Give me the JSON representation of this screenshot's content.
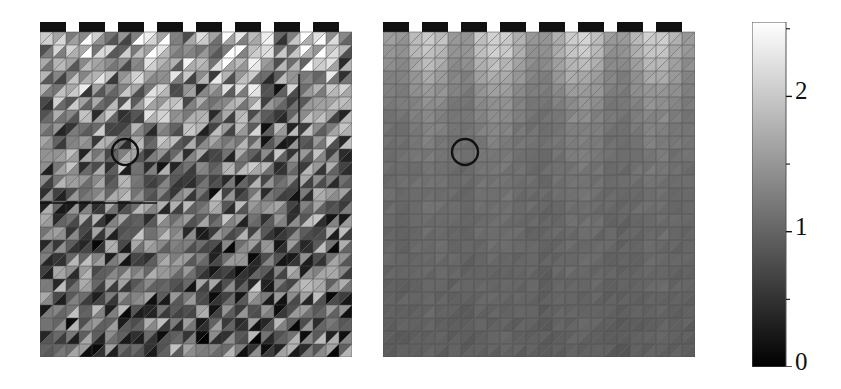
{
  "figure": {
    "title": "",
    "background": "#ffffff",
    "width": 841,
    "height": 389
  },
  "chart_data": {
    "type": "heatmap",
    "title": "",
    "xlabel": "",
    "ylabel": "",
    "colormap": "gray",
    "colorbar": {
      "orientation": "vertical",
      "position": "right",
      "vmin": 0,
      "vmax": 2.55,
      "ticks": [
        0,
        1,
        2
      ],
      "tick_labels": [
        "0",
        "1",
        "2"
      ],
      "low_color": "#000000",
      "high_color": "#ffffff"
    },
    "grid": {
      "nx": 24,
      "ny": 25,
      "cell_px": 13,
      "element": "triangle",
      "mesh_line_color": "#4a4a4a",
      "diagonal": "backslash"
    },
    "crenellations": {
      "count": 8,
      "color": "#111111",
      "block_cells": 2,
      "gap_cells": 1
    },
    "panels": [
      {
        "name": "left-panel",
        "label": "",
        "x": 40,
        "y": 22,
        "width": 312,
        "height": 349,
        "field": "noisy",
        "value_range": [
          0.0,
          2.5
        ],
        "noise_amplitude": 0.85,
        "annotations": {
          "circle": {
            "cx": 125,
            "cy": 152,
            "r": 13,
            "color": "#111111"
          },
          "hline": {
            "x1": 40,
            "x2": 157,
            "y": 203,
            "color": "#111111"
          },
          "vline": {
            "x": 299,
            "y1": 74,
            "y2": 203,
            "color": "#111111"
          }
        }
      },
      {
        "name": "right-panel",
        "label": "",
        "x": 383,
        "y": 22,
        "width": 312,
        "height": 347,
        "field": "smooth",
        "value_range": [
          0.55,
          2.2
        ],
        "noise_amplitude": 0.06,
        "annotations": {
          "circle": {
            "cx": 465,
            "cy": 152,
            "r": 13,
            "color": "#111111"
          }
        }
      }
    ],
    "base_field_rows": [
      [
        1.55,
        1.5,
        1.9,
        2.05,
        1.9,
        1.55,
        1.5,
        1.95,
        2.1,
        2.05,
        1.8,
        1.55,
        1.5,
        1.75,
        2.05,
        2.1,
        1.9,
        1.55,
        1.5,
        1.8,
        2.05,
        2.05,
        1.8,
        1.55
      ],
      [
        1.48,
        1.45,
        1.8,
        1.98,
        1.84,
        1.5,
        1.45,
        1.86,
        2.02,
        1.98,
        1.72,
        1.48,
        1.44,
        1.68,
        1.98,
        2.02,
        1.82,
        1.48,
        1.44,
        1.72,
        1.98,
        1.98,
        1.72,
        1.48
      ],
      [
        1.4,
        1.38,
        1.66,
        1.84,
        1.72,
        1.42,
        1.38,
        1.72,
        1.88,
        1.84,
        1.6,
        1.4,
        1.36,
        1.58,
        1.84,
        1.88,
        1.7,
        1.4,
        1.36,
        1.6,
        1.84,
        1.84,
        1.6,
        1.4
      ],
      [
        1.32,
        1.3,
        1.52,
        1.68,
        1.58,
        1.34,
        1.3,
        1.58,
        1.72,
        1.68,
        1.48,
        1.32,
        1.28,
        1.46,
        1.68,
        1.72,
        1.56,
        1.32,
        1.28,
        1.48,
        1.68,
        1.68,
        1.48,
        1.32
      ],
      [
        1.26,
        1.24,
        1.42,
        1.54,
        1.46,
        1.28,
        1.24,
        1.46,
        1.58,
        1.54,
        1.38,
        1.26,
        1.22,
        1.36,
        1.54,
        1.58,
        1.44,
        1.26,
        1.22,
        1.38,
        1.54,
        1.54,
        1.38,
        1.26
      ],
      [
        1.22,
        1.2,
        1.34,
        1.44,
        1.38,
        1.23,
        1.2,
        1.38,
        1.48,
        1.44,
        1.3,
        1.22,
        1.18,
        1.28,
        1.44,
        1.48,
        1.36,
        1.22,
        1.18,
        1.3,
        1.44,
        1.44,
        1.3,
        1.22
      ],
      [
        1.18,
        1.17,
        1.28,
        1.36,
        1.31,
        1.19,
        1.16,
        1.31,
        1.39,
        1.36,
        1.25,
        1.18,
        1.15,
        1.23,
        1.36,
        1.39,
        1.3,
        1.18,
        1.15,
        1.25,
        1.36,
        1.36,
        1.25,
        1.18
      ],
      [
        1.15,
        1.14,
        1.23,
        1.3,
        1.26,
        1.16,
        1.13,
        1.26,
        1.32,
        1.3,
        1.2,
        1.15,
        1.12,
        1.19,
        1.3,
        1.32,
        1.25,
        1.15,
        1.12,
        1.2,
        1.3,
        1.3,
        1.2,
        1.15
      ],
      [
        1.13,
        1.12,
        1.19,
        1.25,
        1.21,
        1.13,
        1.11,
        1.21,
        1.27,
        1.25,
        1.17,
        1.13,
        1.1,
        1.16,
        1.25,
        1.27,
        1.21,
        1.13,
        1.1,
        1.17,
        1.25,
        1.25,
        1.17,
        1.13
      ],
      [
        1.11,
        1.1,
        1.16,
        1.21,
        1.18,
        1.11,
        1.09,
        1.18,
        1.23,
        1.21,
        1.14,
        1.11,
        1.08,
        1.13,
        1.21,
        1.23,
        1.18,
        1.11,
        1.08,
        1.14,
        1.21,
        1.21,
        1.14,
        1.11
      ],
      [
        1.09,
        1.08,
        1.14,
        1.18,
        1.15,
        1.09,
        1.07,
        1.15,
        1.19,
        1.18,
        1.12,
        1.09,
        1.06,
        1.11,
        1.18,
        1.19,
        1.15,
        1.09,
        1.06,
        1.12,
        1.18,
        1.18,
        1.12,
        1.09
      ],
      [
        1.08,
        1.07,
        1.12,
        1.15,
        1.13,
        1.08,
        1.06,
        1.13,
        1.16,
        1.15,
        1.1,
        1.08,
        1.05,
        1.09,
        1.15,
        1.16,
        1.13,
        1.08,
        1.05,
        1.1,
        1.15,
        1.15,
        1.1,
        1.08
      ],
      [
        1.06,
        1.05,
        1.1,
        1.13,
        1.11,
        1.06,
        1.04,
        1.11,
        1.14,
        1.13,
        1.08,
        1.06,
        1.03,
        1.07,
        1.13,
        1.14,
        1.11,
        1.06,
        1.03,
        1.08,
        1.13,
        1.13,
        1.08,
        1.06
      ],
      [
        1.05,
        1.04,
        1.08,
        1.11,
        1.09,
        1.05,
        1.03,
        1.09,
        1.12,
        1.11,
        1.07,
        1.05,
        1.02,
        1.06,
        1.11,
        1.12,
        1.09,
        1.05,
        1.02,
        1.07,
        1.11,
        1.11,
        1.07,
        1.05
      ],
      [
        1.04,
        1.03,
        1.07,
        1.09,
        1.08,
        1.04,
        1.02,
        1.08,
        1.1,
        1.09,
        1.06,
        1.04,
        1.01,
        1.05,
        1.09,
        1.1,
        1.08,
        1.04,
        1.01,
        1.06,
        1.09,
        1.09,
        1.06,
        1.04
      ],
      [
        1.03,
        1.02,
        1.06,
        1.08,
        1.06,
        1.03,
        1.01,
        1.06,
        1.08,
        1.08,
        1.04,
        1.03,
        1.0,
        1.04,
        1.08,
        1.08,
        1.06,
        1.03,
        1.0,
        1.04,
        1.08,
        1.08,
        1.04,
        1.03
      ],
      [
        1.02,
        1.01,
        1.04,
        1.06,
        1.05,
        1.02,
        1.0,
        1.05,
        1.07,
        1.06,
        1.03,
        1.02,
        0.99,
        1.03,
        1.06,
        1.07,
        1.05,
        1.02,
        0.99,
        1.03,
        1.06,
        1.06,
        1.03,
        1.02
      ],
      [
        1.01,
        1.0,
        1.03,
        1.05,
        1.04,
        1.01,
        0.99,
        1.04,
        1.06,
        1.05,
        1.02,
        1.01,
        0.98,
        1.02,
        1.05,
        1.06,
        1.04,
        1.01,
        0.98,
        1.02,
        1.05,
        1.05,
        1.02,
        1.01
      ],
      [
        1.0,
        0.99,
        1.02,
        1.04,
        1.03,
        1.0,
        0.98,
        1.03,
        1.04,
        1.04,
        1.01,
        1.0,
        0.97,
        1.01,
        1.04,
        1.04,
        1.03,
        1.0,
        0.97,
        1.01,
        1.04,
        1.04,
        1.01,
        1.0
      ],
      [
        0.99,
        0.98,
        1.01,
        1.03,
        1.02,
        0.99,
        0.97,
        1.02,
        1.03,
        1.03,
        1.0,
        0.99,
        0.96,
        1.0,
        1.03,
        1.03,
        1.02,
        0.99,
        0.96,
        1.0,
        1.03,
        1.03,
        1.0,
        0.99
      ],
      [
        0.98,
        0.97,
        1.0,
        1.02,
        1.01,
        0.98,
        0.96,
        1.01,
        1.02,
        1.02,
        0.99,
        0.98,
        0.95,
        0.99,
        1.02,
        1.02,
        1.01,
        0.98,
        0.95,
        0.99,
        1.02,
        1.02,
        0.99,
        0.98
      ],
      [
        0.97,
        0.96,
        0.99,
        1.01,
        1.0,
        0.97,
        0.95,
        1.0,
        1.01,
        1.01,
        0.98,
        0.97,
        0.94,
        0.98,
        1.01,
        1.01,
        1.0,
        0.97,
        0.94,
        0.98,
        1.01,
        1.01,
        0.98,
        0.97
      ],
      [
        0.96,
        0.95,
        0.98,
        1.0,
        0.99,
        0.96,
        0.94,
        0.99,
        1.0,
        1.0,
        0.97,
        0.96,
        0.93,
        0.97,
        1.0,
        1.0,
        0.99,
        0.96,
        0.93,
        0.97,
        1.0,
        1.0,
        0.97,
        0.96
      ],
      [
        0.95,
        0.94,
        0.97,
        0.99,
        0.98,
        0.95,
        0.93,
        0.98,
        0.99,
        0.99,
        0.96,
        0.95,
        0.92,
        0.96,
        0.99,
        0.99,
        0.98,
        0.95,
        0.92,
        0.96,
        0.99,
        0.99,
        0.96,
        0.95
      ],
      [
        0.94,
        0.93,
        0.96,
        0.98,
        0.97,
        0.94,
        0.92,
        0.97,
        0.98,
        0.98,
        0.95,
        0.94,
        0.91,
        0.95,
        0.98,
        0.98,
        0.97,
        0.94,
        0.91,
        0.95,
        0.98,
        0.98,
        0.95,
        0.94
      ]
    ]
  },
  "colorbar_ui": {
    "x": 752,
    "y": 22,
    "width": 34,
    "height": 345,
    "border_color": "#555555",
    "labels": [
      {
        "text": "2",
        "value": 2,
        "x": 795,
        "y": 92
      },
      {
        "text": "1",
        "value": 1,
        "x": 795,
        "y": 228
      },
      {
        "text": "0",
        "value": 0,
        "x": 795,
        "y": 363
      }
    ]
  }
}
